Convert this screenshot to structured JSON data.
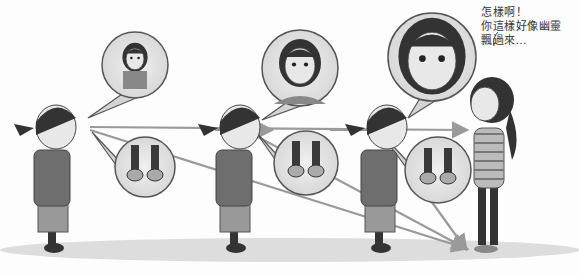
{
  "illustration": {
    "style": "grayscale comic",
    "speech_caption": {
      "line1": "怎樣啊！",
      "line2": "你這樣好像幽靈",
      "line3": "飄過來…"
    },
    "panels": [
      {
        "figure": "boy",
        "thought_top": "girl-far",
        "thought_bottom": "shoes"
      },
      {
        "figure": "boy",
        "thought_top": "girl-mid",
        "thought_bottom": "shoes"
      },
      {
        "figure": "boy",
        "thought_top": "girl-close-sweating",
        "thought_bottom": "shoes"
      }
    ],
    "target_figure": "girl",
    "colors": {
      "background": "#fdfdfd",
      "bubble_fill": "#d4d4d4",
      "bubble_stroke": "#555555",
      "arrow": "#9a9a9a",
      "shirt": "#6e6e6e",
      "hair": "#333333",
      "skin": "#e8e8e8",
      "shadow": "#cfcfcf"
    }
  }
}
